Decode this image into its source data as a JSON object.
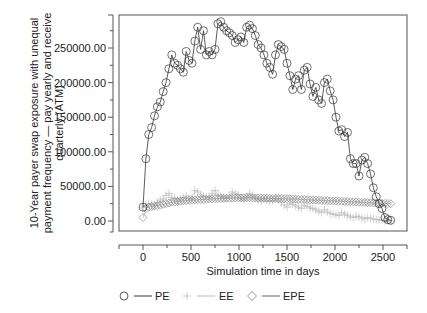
{
  "chart_data": {
    "type": "line",
    "title": "",
    "xlabel": "Simulation time in days",
    "ylabel_lines": [
      "10-Year payer swap exposure with unequal",
      "payment frequency — pay yearly and receive",
      "quarterly (ATM)"
    ],
    "ylabel": "10-Year payer swap exposure with unequal payment frequency — pay yearly and receive quarterly (ATM)",
    "xlim": [
      -250,
      2750
    ],
    "ylim": [
      -15000,
      300000
    ],
    "x_ticks": [
      0,
      500,
      1000,
      1500,
      2000,
      2500
    ],
    "x_tick_labels": [
      "0",
      "500",
      "1000",
      "1500",
      "2000",
      "2500"
    ],
    "y_ticks": [
      0,
      50000,
      100000,
      150000,
      200000,
      250000
    ],
    "y_tick_labels": [
      "0.00",
      "50000.00",
      "100000.00",
      "150000.00",
      "200000.00",
      "250000.00"
    ],
    "grid": false,
    "legend_position": "bottom",
    "legend": [
      "PE",
      "EE",
      "EPE"
    ],
    "series": [
      {
        "name": "PE",
        "marker": "circle",
        "color": "#333333",
        "x": [
          0,
          30,
          60,
          90,
          120,
          150,
          180,
          210,
          240,
          270,
          300,
          330,
          360,
          390,
          420,
          450,
          480,
          510,
          540,
          570,
          600,
          630,
          660,
          690,
          720,
          750,
          780,
          810,
          840,
          870,
          900,
          930,
          960,
          990,
          1020,
          1050,
          1080,
          1110,
          1140,
          1170,
          1200,
          1230,
          1260,
          1290,
          1320,
          1350,
          1380,
          1410,
          1440,
          1470,
          1500,
          1530,
          1560,
          1590,
          1620,
          1650,
          1680,
          1710,
          1740,
          1770,
          1800,
          1830,
          1860,
          1890,
          1920,
          1950,
          1980,
          2010,
          2040,
          2070,
          2100,
          2130,
          2160,
          2190,
          2220,
          2250,
          2280,
          2310,
          2340,
          2370,
          2400,
          2430,
          2460,
          2490,
          2520,
          2550,
          2580
        ],
        "values": [
          20000,
          90000,
          125000,
          135000,
          152000,
          165000,
          172000,
          187000,
          200000,
          220000,
          240000,
          228000,
          225000,
          220000,
          215000,
          245000,
          232000,
          228000,
          260000,
          280000,
          248000,
          275000,
          240000,
          245000,
          240000,
          248000,
          285000,
          288000,
          280000,
          275000,
          272000,
          268000,
          258000,
          262000,
          266000,
          258000,
          280000,
          283000,
          278000,
          268000,
          255000,
          250000,
          240000,
          228000,
          222000,
          212000,
          240000,
          255000,
          252000,
          248000,
          228000,
          210000,
          190000,
          205000,
          210000,
          190000,
          218000,
          222000,
          198000,
          180000,
          193000,
          175000,
          170000,
          200000,
          205000,
          188000,
          175000,
          150000,
          130000,
          132000,
          122000,
          128000,
          90000,
          83000,
          83000,
          65000,
          88000,
          92000,
          83000,
          68000,
          48000,
          35000,
          25000,
          18000,
          5000,
          2000,
          1000
        ]
      },
      {
        "name": "EE",
        "marker": "plus",
        "color": "#aaaaaa",
        "x": [
          0,
          30,
          60,
          90,
          120,
          150,
          180,
          210,
          240,
          270,
          300,
          330,
          360,
          390,
          420,
          450,
          480,
          510,
          540,
          570,
          600,
          630,
          660,
          690,
          720,
          750,
          780,
          810,
          840,
          870,
          900,
          930,
          960,
          990,
          1020,
          1050,
          1080,
          1110,
          1140,
          1170,
          1200,
          1230,
          1260,
          1290,
          1320,
          1350,
          1380,
          1410,
          1440,
          1470,
          1500,
          1530,
          1560,
          1590,
          1620,
          1650,
          1680,
          1710,
          1740,
          1770,
          1800,
          1830,
          1860,
          1890,
          1920,
          1950,
          1980,
          2010,
          2040,
          2070,
          2100,
          2130,
          2160,
          2190,
          2220,
          2250,
          2280,
          2310,
          2340,
          2370,
          2400,
          2430,
          2460,
          2490,
          2520,
          2550,
          2580
        ],
        "values": [
          20000,
          22000,
          25000,
          24000,
          23000,
          27000,
          30000,
          32000,
          37000,
          40000,
          34000,
          33000,
          30000,
          32000,
          34000,
          36000,
          32000,
          33000,
          44000,
          42000,
          38000,
          36000,
          35000,
          34000,
          40000,
          44000,
          38000,
          36000,
          34000,
          33000,
          36000,
          42000,
          40000,
          38000,
          33000,
          30000,
          35000,
          40000,
          36000,
          33000,
          31000,
          29000,
          32000,
          30000,
          28000,
          30000,
          33000,
          31000,
          27000,
          23000,
          20000,
          25000,
          24000,
          22000,
          20000,
          18000,
          23000,
          21000,
          19000,
          18000,
          16000,
          14000,
          12000,
          16000,
          13000,
          11000,
          10000,
          9000,
          8000,
          12000,
          10000,
          8000,
          6000,
          5000,
          7000,
          6000,
          4000,
          3000,
          5000,
          4000,
          3000,
          2000,
          1500,
          1000,
          500,
          200,
          0
        ]
      },
      {
        "name": "EPE",
        "marker": "diamond",
        "color": "#777777",
        "x": [
          0,
          30,
          60,
          90,
          120,
          150,
          180,
          210,
          240,
          270,
          300,
          330,
          360,
          390,
          420,
          450,
          480,
          510,
          540,
          570,
          600,
          630,
          660,
          690,
          720,
          750,
          780,
          810,
          840,
          870,
          900,
          930,
          960,
          990,
          1020,
          1050,
          1080,
          1110,
          1140,
          1170,
          1200,
          1230,
          1260,
          1290,
          1320,
          1350,
          1380,
          1410,
          1440,
          1470,
          1500,
          1530,
          1560,
          1590,
          1620,
          1650,
          1680,
          1710,
          1740,
          1770,
          1800,
          1830,
          1860,
          1890,
          1920,
          1950,
          1980,
          2010,
          2040,
          2070,
          2100,
          2130,
          2160,
          2190,
          2220,
          2250,
          2280,
          2310,
          2340,
          2370,
          2400,
          2430,
          2460,
          2490,
          2520,
          2550,
          2580
        ],
        "values": [
          5000,
          18000,
          20000,
          21000,
          21500,
          22000,
          23000,
          24000,
          25000,
          26000,
          27000,
          27500,
          28000,
          28500,
          29000,
          29500,
          30000,
          30200,
          30500,
          30800,
          31000,
          31200,
          31500,
          31700,
          32000,
          32200,
          32400,
          32600,
          32800,
          33000,
          33000,
          33100,
          33200,
          33300,
          33400,
          33500,
          33500,
          33500,
          33400,
          33300,
          33200,
          33100,
          33000,
          32900,
          32800,
          32700,
          32600,
          32500,
          32400,
          32300,
          32200,
          32000,
          31800,
          31600,
          31400,
          31200,
          31000,
          30800,
          30600,
          30400,
          30200,
          30000,
          29800,
          29600,
          29400,
          29200,
          29000,
          28800,
          28600,
          28400,
          28200,
          28000,
          27800,
          27600,
          27400,
          27200,
          27000,
          26800,
          26600,
          26400,
          26200,
          26000,
          25800,
          25600,
          25400,
          25200,
          25000
        ]
      }
    ]
  }
}
